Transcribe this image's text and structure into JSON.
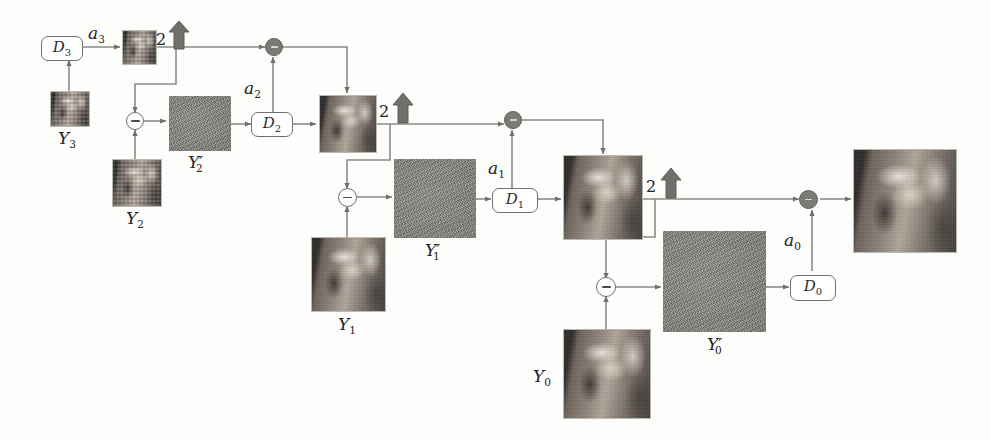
{
  "figure": {
    "stroke_color": "#6f6f6c",
    "accent_color": "#7b7b78",
    "noise_color": "#8b8b86"
  },
  "labels": {
    "a3": "a",
    "a3_sub": "3",
    "a2": "a",
    "a2_sub": "2",
    "a1": "a",
    "a1_sub": "1",
    "a0": "a",
    "a0_sub": "0",
    "D3": "D",
    "D3_sub": "3",
    "D2": "D",
    "D2_sub": "2",
    "D1": "D",
    "D1_sub": "1",
    "D0": "D",
    "D0_sub": "0",
    "Y3": "Y",
    "Y3_sub": "3",
    "Y2": "Y",
    "Y2_sub": "2",
    "Y1": "Y",
    "Y1_sub": "1",
    "Y0": "Y",
    "Y0_sub": "0",
    "Y2p": "Y",
    "Y2p_sub": "2",
    "Y2p_prime": "′",
    "Y1p": "Y",
    "Y1p_sub": "1",
    "Y1p_prime": "′",
    "Y0p": "Y",
    "Y0p_sub": "0",
    "Y0p_prime": "′",
    "upsample_factor_3": "2",
    "upsample_factor_2": "2",
    "upsample_factor_1": "2",
    "minus_sign": "−",
    "plus_sign": "+"
  },
  "nodes": {
    "encoders": [
      {
        "name": "D3",
        "label": "D",
        "sub": "3"
      },
      {
        "name": "D2",
        "label": "D",
        "sub": "2"
      },
      {
        "name": "D1",
        "label": "D",
        "sub": "1"
      },
      {
        "name": "D0",
        "label": "D",
        "sub": "0"
      }
    ],
    "bitstreams": [
      {
        "name": "a3",
        "label": "a",
        "sub": "3"
      },
      {
        "name": "a2",
        "label": "a",
        "sub": "2"
      },
      {
        "name": "a1",
        "label": "a",
        "sub": "1"
      },
      {
        "name": "a0",
        "label": "a",
        "sub": "0"
      }
    ],
    "source_images": [
      {
        "name": "Y3",
        "label": "Y",
        "sub": "3"
      },
      {
        "name": "Y2",
        "label": "Y",
        "sub": "2"
      },
      {
        "name": "Y1",
        "label": "Y",
        "sub": "1"
      },
      {
        "name": "Y0",
        "label": "Y",
        "sub": "0"
      }
    ],
    "residuals": [
      {
        "name": "Y2p",
        "label": "Y",
        "sub": "2",
        "prime": "′"
      },
      {
        "name": "Y1p",
        "label": "Y",
        "sub": "1",
        "prime": "′"
      },
      {
        "name": "Y0p",
        "label": "Y",
        "sub": "0",
        "prime": "′"
      }
    ],
    "upsamplers": [
      {
        "name": "upsample-stage-3",
        "factor": "2"
      },
      {
        "name": "upsample-stage-2",
        "factor": "2"
      },
      {
        "name": "upsample-stage-1",
        "factor": "2"
      }
    ],
    "adders": [
      {
        "name": "adder-stage-2",
        "op": "+"
      },
      {
        "name": "adder-stage-1",
        "op": "+"
      },
      {
        "name": "adder-stage-0",
        "op": "+"
      }
    ],
    "subtractors": [
      {
        "name": "subtractor-stage-2",
        "op": "−"
      },
      {
        "name": "subtractor-stage-1",
        "op": "−"
      },
      {
        "name": "subtractor-stage-0",
        "op": "−"
      }
    ]
  }
}
